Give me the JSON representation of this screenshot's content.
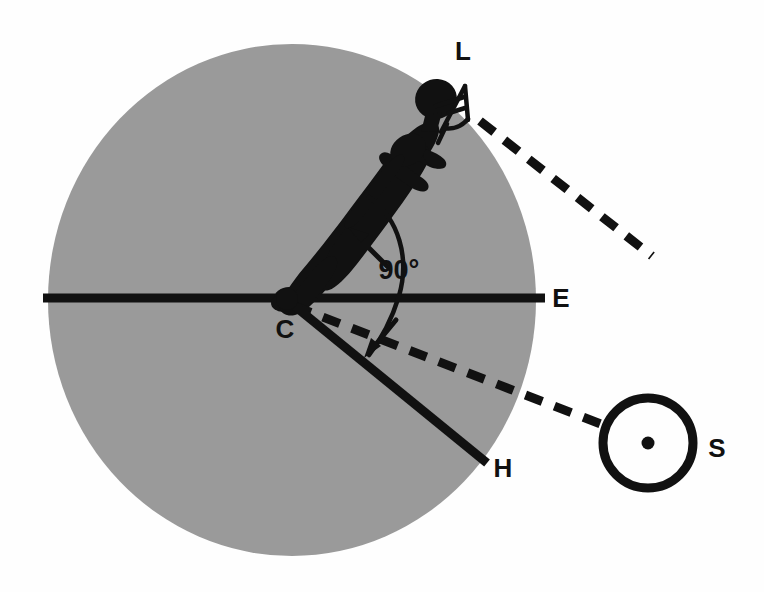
{
  "figure": {
    "background_color": "#fefefe",
    "earth_fill": "#9a9a9a",
    "ink_color": "#111111"
  },
  "labels": {
    "L": "L",
    "C": "C",
    "E": "E",
    "H": "H",
    "S": "S",
    "angle": "90°"
  },
  "annotations": {
    "angle_value": "90°",
    "angle_degrees": 90
  },
  "geometry": {
    "earth_circle": {
      "cx": 292,
      "cy": 300,
      "rx": 244,
      "ry": 256
    },
    "sun_circle": {
      "cx": 648,
      "cy": 443,
      "r": 45,
      "stroke_width": 9
    },
    "sun_center_dot": {
      "cx": 648,
      "cy": 443,
      "r": 6
    },
    "observer_point_C": {
      "x": 287,
      "y": 299
    },
    "horizon_line_E": {
      "x1": 43,
      "y1": 298,
      "x2": 545,
      "y2": 298,
      "width": 9
    },
    "horizontal_plane_H": {
      "x1": 291,
      "y1": 303,
      "x2": 487,
      "y2": 463,
      "width": 9
    },
    "sight_line_upper": {
      "x1": 480,
      "y1": 121,
      "x2": 652,
      "y2": 256,
      "dash": "17 13",
      "width": 9
    },
    "sight_line_to_sun": {
      "x1": 294,
      "y1": 306,
      "x2": 606,
      "y2": 426,
      "dash": "17 13",
      "width": 9
    },
    "angle_arc": {
      "cx": 287,
      "cy": 299,
      "r": 112,
      "start_deg": -43,
      "end_deg": 28
    },
    "arrow_upper": {
      "tail_x": 388,
      "tail_y": 267,
      "tip_x": 350,
      "tip_y": 229
    },
    "arrow_lower": {
      "tail_x": 397,
      "tail_y": 321,
      "tip_x": 366,
      "tip_y": 356
    }
  },
  "label_positions": {
    "L": {
      "x": 463,
      "y": 60
    },
    "C": {
      "x": 285,
      "y": 338
    },
    "E": {
      "x": 561,
      "y": 307
    },
    "H": {
      "x": 503,
      "y": 477
    },
    "S": {
      "x": 717,
      "y": 457
    },
    "angle": {
      "x": 399,
      "y": 279
    }
  }
}
